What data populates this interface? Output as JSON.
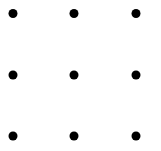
{
  "figure": {
    "name": "dot-grid",
    "width": 161,
    "height": 151,
    "background_color": "#ffffff"
  },
  "chart_data": {
    "type": "scatter",
    "title": "",
    "subtitle": "",
    "xlabel": "",
    "ylabel": "",
    "grid": false,
    "legend": null,
    "legend_position": "none",
    "axis_visible": false,
    "tick_labels_x": [],
    "tick_labels_y": [],
    "xlim": [
      0,
      161
    ],
    "ylim": [
      0,
      151
    ],
    "marker": {
      "shape": "circle",
      "color": "#000000",
      "diameter_px": 9,
      "radius_px": 4.5,
      "edge_color": "#000000",
      "count": 9
    },
    "columns_x": [
      13,
      74,
      136
    ],
    "rows_y": [
      13.5,
      75,
      136
    ],
    "series": [
      {
        "name": "dots",
        "color": "#000000",
        "points": [
          {
            "label": "row1-col1",
            "x": 13,
            "y": 13.5
          },
          {
            "label": "row1-col2",
            "x": 74,
            "y": 13.5
          },
          {
            "label": "row1-col3",
            "x": 136,
            "y": 13.5
          },
          {
            "label": "row2-col1",
            "x": 13,
            "y": 75
          },
          {
            "label": "row2-col2",
            "x": 74,
            "y": 75
          },
          {
            "label": "row2-col3",
            "x": 136,
            "y": 75
          },
          {
            "label": "row3-col1",
            "x": 13,
            "y": 136
          },
          {
            "label": "row3-col2",
            "x": 74,
            "y": 136
          },
          {
            "label": "row3-col3",
            "x": 136,
            "y": 136
          }
        ]
      }
    ],
    "annotations": []
  }
}
